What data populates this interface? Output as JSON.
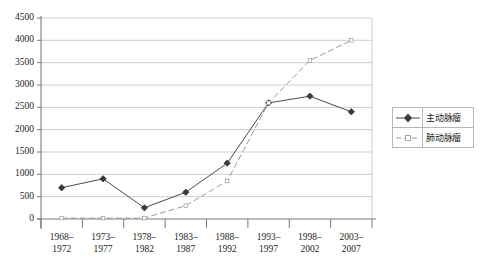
{
  "chart_data": {
    "type": "line",
    "title": "",
    "xlabel": "",
    "ylabel": "",
    "ylim": [
      0,
      4500
    ],
    "ytick_step": 500,
    "grid": true,
    "legend_position": "right",
    "categories": [
      "1968–\n1972",
      "1973–\n1977",
      "1978–\n1982",
      "1983–\n1987",
      "1988–\n1992",
      "1993–\n1997",
      "1998–\n2002",
      "2003–\n2007"
    ],
    "category_lines": [
      [
        "1968–",
        "1972"
      ],
      [
        "1973–",
        "1977"
      ],
      [
        "1978–",
        "1982"
      ],
      [
        "1983–",
        "1987"
      ],
      [
        "1988–",
        "1992"
      ],
      [
        "1993–",
        "1997"
      ],
      [
        "1998–",
        "2002"
      ],
      [
        "2003–",
        "2007"
      ]
    ],
    "yticks": [
      0,
      500,
      1000,
      1500,
      2000,
      2500,
      3000,
      3500,
      4000,
      4500
    ],
    "ytick_labels": [
      "0",
      "500",
      "1000",
      "1500",
      "2000",
      "2500",
      "3000",
      "3500",
      "4000",
      "4500"
    ],
    "series": [
      {
        "name": "主动脉瘤",
        "marker": "diamond",
        "line_style": "solid",
        "color": "#4a4a4a",
        "values": [
          700,
          900,
          250,
          600,
          1250,
          2600,
          2750,
          2400
        ]
      },
      {
        "name": "肺动脉瘤",
        "marker": "dash",
        "line_style": "dashed",
        "color": "#9a9a9a",
        "values": [
          20,
          20,
          20,
          300,
          850,
          2600,
          3550,
          4000
        ]
      }
    ]
  },
  "legend": {
    "items": [
      {
        "label": "主动脉瘤",
        "key": "diamond-line-key"
      },
      {
        "label": "肺动脉瘤",
        "key": "dashed-line-key"
      }
    ]
  },
  "colors": {
    "series_1": "#4a4a4a",
    "series_2": "#9a9a9a",
    "grid": "#c9c9c9",
    "axis": "#7a7a7a",
    "text": "#231f20",
    "legend_border": "#b8b8b8",
    "background": "#ffffff"
  }
}
